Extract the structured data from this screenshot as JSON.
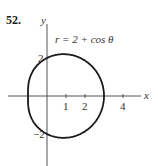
{
  "problem": {
    "number": "52."
  },
  "chart_data": {
    "type": "line",
    "subtype": "polar-curve",
    "title": "r = 2 + cos θ",
    "equation": "r = 2 + cos θ",
    "xlabel": "x",
    "ylabel": "y",
    "x_ticks": [
      1,
      2,
      4
    ],
    "x_tick_labels": [
      "1",
      "2",
      "4"
    ],
    "y_ticks": [
      2,
      -2
    ],
    "y_tick_labels": [
      "2",
      "−2"
    ],
    "xlim": [
      -2,
      5
    ],
    "ylim": [
      -3.5,
      3.8
    ],
    "grid": false,
    "legend": null,
    "series": [
      {
        "name": "r = 2 + cos θ",
        "key_points": [
          {
            "theta": "0",
            "x": 3,
            "y": 0
          },
          {
            "theta": "π/2",
            "x": 0,
            "y": 2
          },
          {
            "theta": "π",
            "x": -1,
            "y": 0
          },
          {
            "theta": "3π/2",
            "x": 0,
            "y": -2
          }
        ]
      }
    ]
  },
  "style": {
    "curve_color": "#1a1a1a",
    "axis_color": "#555555"
  }
}
